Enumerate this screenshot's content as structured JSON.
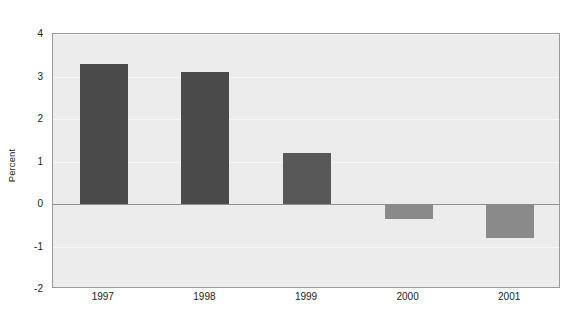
{
  "chart_data": {
    "type": "bar",
    "title": "",
    "subtitle": "",
    "xlabel": "",
    "ylabel": "Percent",
    "categories": [
      "1997",
      "1998",
      "1999",
      "2000",
      "2001"
    ],
    "values": [
      3.3,
      3.1,
      1.2,
      -0.35,
      -0.8
    ],
    "series": [
      {
        "name": "Percent",
        "values": [
          3.3,
          3.1,
          1.2,
          -0.35,
          -0.8
        ]
      }
    ],
    "bar_colors": [
      "#4a4a4a",
      "#4a4a4a",
      "#585858",
      "#8a8a8a",
      "#8a8a8a"
    ],
    "ylim": [
      -2,
      4
    ],
    "xlim": [
      0,
      5
    ],
    "y_ticks": [
      4,
      3,
      2,
      1,
      0,
      -1,
      -2
    ],
    "y_tick_labels": [
      "4",
      "3",
      "2",
      "1",
      "0",
      "-1",
      "-2"
    ],
    "x_tick_labels": [
      "1997",
      "1998",
      "1999",
      "2000",
      "2001"
    ],
    "grid": true,
    "grid_color": "#f7f7f7",
    "zero_line_color": "#8f8f8f",
    "legend": null,
    "legend_position": "none",
    "plot_background": "#ececec",
    "figure_background": "#ffffff",
    "border_color": "#9a9a9a",
    "annotations": []
  }
}
